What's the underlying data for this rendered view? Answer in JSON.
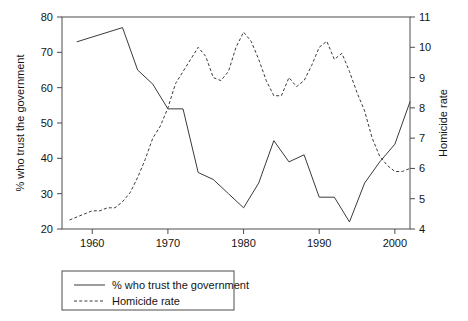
{
  "chart_data": {
    "type": "line",
    "title": "",
    "xlabel": "",
    "ylabel": "% who trust the government",
    "y2label": "Homicide rate",
    "xlim": [
      1956,
      2002
    ],
    "ylim": [
      20,
      80
    ],
    "y2lim": [
      4,
      11
    ],
    "grid": false,
    "legend_position": "below-left",
    "x_ticks": [
      1960,
      1970,
      1980,
      1990,
      2000
    ],
    "x_tick_labels": [
      "1960",
      "1970",
      "1980",
      "1990",
      "2000"
    ],
    "y_ticks": [
      20,
      30,
      40,
      50,
      60,
      70,
      80
    ],
    "y_tick_labels": [
      "20",
      "30",
      "40",
      "50",
      "60",
      "70",
      "80"
    ],
    "y2_ticks": [
      4,
      5,
      6,
      7,
      8,
      9,
      10,
      11
    ],
    "y2_tick_labels": [
      "4",
      "5",
      "6",
      "7",
      "8",
      "9",
      "10",
      "11"
    ],
    "series": [
      {
        "name": "% who trust the government",
        "axis": "left",
        "style": "solid",
        "color": "#3a3a3a",
        "x": [
          1958,
          1964,
          1966,
          1968,
          1970,
          1972,
          1974,
          1976,
          1978,
          1980,
          1982,
          1984,
          1986,
          1988,
          1990,
          1992,
          1994,
          1996,
          1998,
          2000,
          2002
        ],
        "values": [
          73,
          77,
          65,
          61,
          54,
          54,
          36,
          34,
          30,
          26,
          33,
          45,
          39,
          41,
          29,
          29,
          22,
          33,
          39,
          44,
          56
        ]
      },
      {
        "name": "Homicide rate",
        "axis": "right",
        "style": "dashed",
        "color": "#3a3a3a",
        "x": [
          1957,
          1958,
          1959,
          1960,
          1961,
          1962,
          1963,
          1964,
          1965,
          1966,
          1967,
          1968,
          1969,
          1970,
          1971,
          1972,
          1973,
          1974,
          1975,
          1976,
          1977,
          1978,
          1979,
          1980,
          1981,
          1982,
          1983,
          1984,
          1985,
          1986,
          1987,
          1988,
          1989,
          1990,
          1991,
          1992,
          1993,
          1994,
          1995,
          1996,
          1997,
          1998,
          1999,
          2000,
          2001,
          2002
        ],
        "values": [
          4.3,
          4.4,
          4.5,
          4.6,
          4.6,
          4.7,
          4.7,
          4.9,
          5.2,
          5.7,
          6.3,
          7.0,
          7.4,
          8.0,
          8.8,
          9.2,
          9.6,
          10.0,
          9.7,
          9.0,
          8.9,
          9.2,
          10.0,
          10.5,
          10.2,
          9.6,
          8.9,
          8.4,
          8.4,
          9.0,
          8.7,
          8.9,
          9.4,
          10.0,
          10.2,
          9.6,
          9.8,
          9.2,
          8.5,
          7.9,
          7.0,
          6.4,
          6.1,
          5.9,
          5.9,
          6.0
        ]
      }
    ]
  },
  "legend": {
    "items": [
      {
        "label": "% who trust the government",
        "style": "solid"
      },
      {
        "label": "Homicide rate",
        "style": "dashed"
      }
    ]
  },
  "axes": {
    "left_title": "% who trust the government",
    "right_title": "Homicide rate"
  }
}
